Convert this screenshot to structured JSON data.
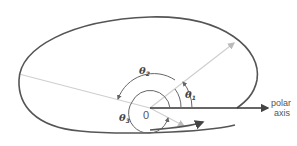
{
  "diagram": {
    "labels": {
      "theta1": "θ",
      "theta1_sub": "1",
      "theta2": "θ",
      "theta2_sub": "2",
      "theta3": "θ",
      "theta3_sub": "3",
      "origin": "0",
      "polar_axis_line1": "polar",
      "polar_axis_line2": "axis"
    },
    "colors": {
      "curve": "#555555",
      "rays": "#c8c8c8",
      "arcs": "#666666",
      "axis": "#333333"
    }
  }
}
